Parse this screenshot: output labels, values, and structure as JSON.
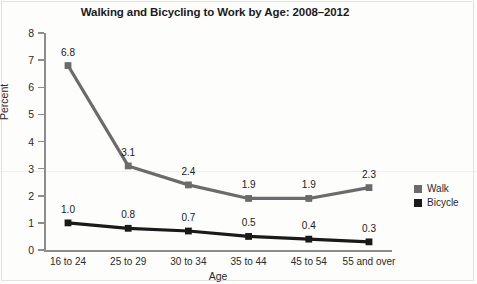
{
  "chart_data": {
    "type": "line",
    "title": "Walking and Bicycling to Work by Age: 2008–2012",
    "xlabel": "Age",
    "ylabel": "Percent",
    "categories": [
      "16 to 24",
      "25 to 29",
      "30 to 34",
      "35 to 44",
      "45 to 54",
      "55 and over"
    ],
    "series": [
      {
        "name": "Walk",
        "color": "#6b6b6b",
        "values": [
          6.8,
          3.1,
          2.4,
          1.9,
          1.9,
          2.3
        ],
        "labels": [
          "6.8",
          "3.1",
          "2.4",
          "1.9",
          "1.9",
          "2.3"
        ]
      },
      {
        "name": "Bicycle",
        "color": "#1a1a1a",
        "values": [
          1.0,
          0.8,
          0.7,
          0.5,
          0.4,
          0.3
        ],
        "labels": [
          "1.0",
          "0.8",
          "0.7",
          "0.5",
          "0.4",
          "0.3"
        ]
      }
    ],
    "ylim": [
      0,
      8
    ],
    "yticks": [
      0,
      1,
      2,
      3,
      4,
      5,
      6,
      7,
      8
    ],
    "ytick_labels": [
      "0",
      "1",
      "2",
      "3",
      "4",
      "5",
      "6",
      "7",
      "8"
    ],
    "grid": false,
    "legend_position": "right",
    "legend_entries": [
      "Walk",
      "Bicycle"
    ]
  }
}
